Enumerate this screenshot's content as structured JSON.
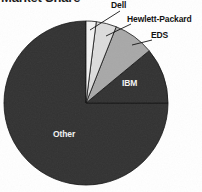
{
  "chart_data": {
    "type": "pie",
    "title": "Market Share",
    "xlabel": "",
    "ylabel": "",
    "legend_position": "none",
    "grid": false,
    "categories": [
      "Dell",
      "Hewlett-Packard",
      "EDS",
      "IBM",
      "Other"
    ],
    "values": [
      2,
      4,
      8,
      11,
      75
    ],
    "unit": "%",
    "start_angle_deg": 0,
    "direction": "clockwise",
    "slices": [
      {
        "label": "Dell",
        "value": 2,
        "color": "#f4f4f4",
        "label_placement": "outside"
      },
      {
        "label": "Hewlett-Packard",
        "value": 4,
        "color": "#dcdcdc",
        "label_placement": "outside"
      },
      {
        "label": "EDS",
        "value": 8,
        "color": "#a8a8a8",
        "label_placement": "outside"
      },
      {
        "label": "IBM",
        "value": 11,
        "color": "#333333",
        "label_placement": "inside"
      },
      {
        "label": "Other",
        "value": 75,
        "color": "#333333",
        "label_placement": "inside"
      }
    ]
  },
  "labels": {
    "dell": "Dell",
    "hp": "Hewlett-Packard",
    "eds": "EDS",
    "ibm": "IBM",
    "other": "Other"
  },
  "colors": {
    "slice_dell": "#f4f4f4",
    "slice_hp": "#dcdcdc",
    "slice_eds": "#a8a8a8",
    "slice_ibm": "#333333",
    "slice_other": "#333333",
    "outline": "#111111",
    "label_dark": "#121212",
    "label_light": "#f2f2f2",
    "background": "#ffffff"
  }
}
